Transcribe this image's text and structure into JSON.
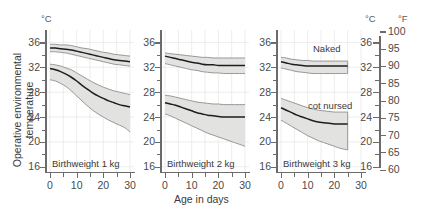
{
  "figure": {
    "ylabel": "Operative environmental temperature",
    "y_unit": "°C",
    "xlabel": "Age in days",
    "right_unit_c": "°C",
    "right_unit_f": "°F"
  },
  "axes": {
    "y_ticks": [
      36,
      32,
      28,
      24,
      20,
      16
    ],
    "y_minor_ticks": [
      34,
      30,
      26,
      22,
      18
    ],
    "ylim": [
      15,
      38
    ],
    "x_ticks": [
      0,
      10,
      20,
      30
    ],
    "x_minor_ticks": [
      5,
      15,
      25
    ],
    "xlim": [
      -1.5,
      31.5
    ],
    "right_c_ticks": [
      36,
      32,
      28,
      24,
      20,
      16
    ],
    "right_f_ticks": [
      100,
      95,
      90,
      85,
      80,
      75,
      70,
      65,
      60
    ],
    "flim": [
      59,
      101
    ]
  },
  "annotations": {
    "naked": "Naked",
    "cot_nursed": "cot nursed"
  },
  "chart_data": {
    "type": "area",
    "title": "",
    "xlabel": "Age in days",
    "ylabel": "Operative environmental temperature",
    "y_unit": "°C",
    "secondary_y_unit": "°F",
    "xlim": [
      -1.5,
      31.5
    ],
    "ylim": [
      15,
      38
    ],
    "grid": true,
    "legend": [
      "Naked",
      "cot nursed"
    ],
    "legend_position": "inside-panel-3",
    "panels": [
      {
        "name": "panel-1kg",
        "label": "Birthweight 1 kg",
        "x": [
          0,
          2,
          4,
          6,
          8,
          10,
          12,
          14,
          16,
          18,
          20,
          22,
          24,
          26,
          28,
          30
        ],
        "series": [
          {
            "name": "Naked",
            "mean": [
              35.1,
              35.1,
              35.0,
              34.9,
              34.8,
              34.6,
              34.4,
              34.2,
              34.0,
              33.8,
              33.6,
              33.4,
              33.2,
              33.1,
              33.0,
              32.9
            ],
            "upper": [
              35.7,
              35.7,
              35.6,
              35.6,
              35.5,
              35.3,
              35.1,
              35.0,
              34.8,
              34.6,
              34.4,
              34.3,
              34.1,
              34.0,
              33.9,
              33.8
            ],
            "lower": [
              34.5,
              34.5,
              34.4,
              34.3,
              34.1,
              33.9,
              33.7,
              33.5,
              33.3,
              33.1,
              32.9,
              32.7,
              32.5,
              32.4,
              32.3,
              32.2
            ]
          },
          {
            "name": "cot nursed",
            "mean": [
              31.8,
              31.6,
              31.3,
              30.9,
              30.4,
              29.8,
              29.1,
              28.5,
              27.9,
              27.4,
              27.0,
              26.6,
              26.3,
              26.0,
              25.8,
              25.6
            ],
            "upper": [
              32.5,
              32.4,
              32.2,
              31.9,
              31.6,
              31.1,
              30.6,
              30.1,
              29.6,
              29.2,
              28.8,
              28.5,
              28.2,
              28.0,
              27.8,
              27.6
            ],
            "lower": [
              30.0,
              29.8,
              29.4,
              28.9,
              28.2,
              27.4,
              26.6,
              25.8,
              25.1,
              24.5,
              24.0,
              23.5,
              23.1,
              22.7,
              22.3,
              21.6
            ]
          }
        ]
      },
      {
        "name": "panel-2kg",
        "label": "Birthweight 2 kg",
        "x": [
          0,
          2,
          4,
          6,
          8,
          10,
          12,
          14,
          16,
          18,
          20,
          22,
          24,
          26,
          28,
          30
        ],
        "series": [
          {
            "name": "Naked",
            "mean": [
              33.8,
              33.6,
              33.4,
              33.2,
              33.0,
              32.8,
              32.7,
              32.5,
              32.4,
              32.4,
              32.3,
              32.3,
              32.3,
              32.3,
              32.3,
              32.3
            ],
            "upper": [
              34.3,
              34.2,
              34.1,
              34.0,
              33.9,
              33.8,
              33.7,
              33.6,
              33.6,
              33.5,
              33.5,
              33.5,
              33.5,
              33.5,
              33.5,
              33.5
            ],
            "lower": [
              32.6,
              32.4,
              32.2,
              32.0,
              31.8,
              31.6,
              31.5,
              31.3,
              31.2,
              31.1,
              31.1,
              31.0,
              31.0,
              31.0,
              31.0,
              31.0
            ]
          },
          {
            "name": "cot nursed",
            "mean": [
              26.3,
              26.1,
              25.9,
              25.6,
              25.3,
              25.0,
              24.7,
              24.5,
              24.3,
              24.2,
              24.1,
              24.0,
              24.0,
              24.0,
              24.0,
              24.0
            ],
            "upper": [
              27.5,
              27.4,
              27.2,
              27.0,
              26.8,
              26.6,
              26.4,
              26.3,
              26.2,
              26.1,
              26.1,
              26.0,
              26.0,
              26.0,
              26.0,
              26.0
            ],
            "lower": [
              24.5,
              24.2,
              23.8,
              23.4,
              23.0,
              22.6,
              22.2,
              21.8,
              21.4,
              21.1,
              20.8,
              20.5,
              20.2,
              19.9,
              19.6,
              19.3
            ]
          }
        ]
      },
      {
        "name": "panel-3kg",
        "label": "Birthweight 3 kg",
        "x": [
          0,
          2,
          4,
          6,
          8,
          10,
          12,
          14,
          16,
          18,
          20,
          22,
          24,
          25
        ],
        "series": [
          {
            "name": "Naked",
            "mean": [
              32.9,
              32.7,
              32.5,
              32.4,
              32.3,
              32.2,
              32.2,
              32.2,
              32.2,
              32.2,
              32.2,
              32.2,
              32.2,
              32.2
            ],
            "upper": [
              33.6,
              33.5,
              33.3,
              33.2,
              33.1,
              33.1,
              33.0,
              33.0,
              33.0,
              33.0,
              33.0,
              33.0,
              33.0,
              33.0
            ],
            "lower": [
              31.9,
              31.7,
              31.5,
              31.3,
              31.2,
              31.1,
              31.0,
              31.0,
              31.0,
              31.0,
              31.0,
              31.0,
              31.0,
              31.0
            ]
          },
          {
            "name": "cot nursed",
            "mean": [
              25.5,
              25.1,
              24.7,
              24.3,
              24.0,
              23.7,
              23.4,
              23.2,
              23.1,
              23.0,
              22.9,
              22.9,
              22.9,
              22.9
            ],
            "upper": [
              27.0,
              26.7,
              26.4,
              26.1,
              25.8,
              25.5,
              25.3,
              25.1,
              25.0,
              24.9,
              24.8,
              24.8,
              24.8,
              24.8
            ],
            "lower": [
              23.5,
              23.0,
              22.5,
              22.0,
              21.5,
              21.0,
              20.6,
              20.2,
              19.9,
              19.6,
              19.3,
              19.0,
              18.8,
              18.7
            ]
          }
        ]
      }
    ]
  },
  "colors": {
    "band_fill": "#e2e2e0",
    "band_edge": "#8f8f8f",
    "mean_line": "#1e1e1e",
    "axis": "#6b6b6b",
    "grid": "#e8e8ea",
    "text": "#3b3b3b"
  }
}
